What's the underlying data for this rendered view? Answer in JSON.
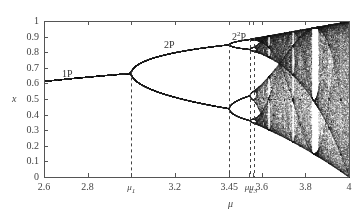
{
  "chart_data": {
    "type": "scatter",
    "title": "",
    "xlabel": "μ",
    "ylabel": "x",
    "xlim": [
      2.6,
      4.0
    ],
    "ylim": [
      0,
      1
    ],
    "grid": false,
    "legend": "none",
    "x_ticks": [
      {
        "value": 2.6,
        "label": "2.6"
      },
      {
        "value": 2.8,
        "label": "2.8"
      },
      {
        "value": 3.0,
        "label": "μ1",
        "symbolic": true
      },
      {
        "value": 3.2,
        "label": "3.2"
      },
      {
        "value": 3.45,
        "label": "3.45"
      },
      {
        "value": 3.54,
        "label": "μ2",
        "symbolic": true
      },
      {
        "value": 3.56,
        "label": "μ3",
        "symbolic": true
      },
      {
        "value": 3.6,
        "label": "3.6"
      },
      {
        "value": 3.8,
        "label": "3.8"
      },
      {
        "value": 4.0,
        "label": "4"
      }
    ],
    "y_ticks": [
      "0",
      "0.1",
      "0.2",
      "0.3",
      "0.4",
      "0.5",
      "0.6",
      "0.7",
      "0.8",
      "0.9",
      "1"
    ],
    "dashed_markers": [
      {
        "mu": 3.0,
        "label": "μ1"
      },
      {
        "mu": 3.449,
        "label": "3.45"
      },
      {
        "mu": 3.544,
        "label": "μ2"
      },
      {
        "mu": 3.564,
        "label": "μ3"
      }
    ],
    "annotations": [
      {
        "text": "1P",
        "mu": 2.72,
        "x": 0.66
      },
      {
        "text": "2P",
        "mu": 3.18,
        "x": 0.83
      },
      {
        "text": "2²P",
        "mu": 3.46,
        "x": 0.91
      }
    ],
    "regions": [
      {
        "name": "period-1",
        "mu_range": [
          2.6,
          3.0
        ],
        "x_formula": "1 - 1/mu"
      },
      {
        "name": "period-2",
        "mu_range": [
          3.0,
          3.449
        ]
      },
      {
        "name": "period-4",
        "mu_range": [
          3.449,
          3.544
        ]
      },
      {
        "name": "chaos",
        "mu_range": [
          3.57,
          4.0
        ],
        "windows": [
          3.63,
          3.74,
          3.83
        ]
      }
    ],
    "sampling": {
      "mu_steps": 900,
      "transient": 300,
      "plotted_iterations": 180
    }
  },
  "labels": {
    "y_axis": "x",
    "x_axis": "μ",
    "ann_1p": "1P",
    "ann_2p": "2P",
    "ann_22p_base": "2",
    "ann_22p_sup": "2",
    "ann_22p_tail": "P"
  },
  "style": {
    "axis_color": "#555555",
    "point_color": "#222222",
    "dash_color": "#444444"
  }
}
